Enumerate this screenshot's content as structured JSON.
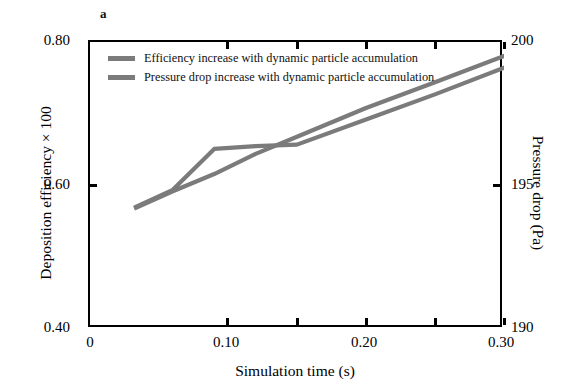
{
  "figure": {
    "panel_label": "a"
  },
  "legend": {
    "items": [
      {
        "label": "Efficiency increase with dynamic particle accumulation",
        "color": "#7b7b7b"
      },
      {
        "label": "Pressure drop increase with dynamic particle accumulation",
        "color": "#7b7b7b"
      }
    ]
  },
  "axes": {
    "x": {
      "title": "Simulation time (s)",
      "ticks": [
        "0",
        "0.10",
        "0.20",
        "0.30"
      ],
      "tick_values": [
        0,
        0.1,
        0.2,
        0.3
      ],
      "minor_tick_values": [
        0.05,
        0.15,
        0.25
      ],
      "range": [
        0,
        0.3
      ]
    },
    "y_left": {
      "title": "Deposition efficiency × 100",
      "ticks": [
        "0.40",
        "0.60",
        "0.80"
      ],
      "tick_values": [
        0.4,
        0.6,
        0.8
      ],
      "range": [
        0.4,
        0.8
      ]
    },
    "y_right": {
      "title": "Pressure drop (Pa)",
      "ticks": [
        "190",
        "195",
        "200"
      ],
      "tick_values": [
        190,
        195,
        200
      ],
      "range": [
        190,
        200
      ]
    }
  },
  "chart_data": {
    "type": "line",
    "title": "",
    "subtitle": "",
    "panel": "a",
    "xlabel": "Simulation time (s)",
    "ylabel": "Deposition efficiency × 100",
    "ylabel_secondary": "Pressure drop (Pa)",
    "xlim": [
      0,
      0.3
    ],
    "ylim": [
      0.4,
      0.8
    ],
    "ylim_secondary": [
      190,
      200
    ],
    "grid": false,
    "legend_position": "upper-left-inside",
    "series": [
      {
        "name": "Efficiency increase with dynamic particle accumulation",
        "axis": "left",
        "color": "#7b7b7b",
        "x": [
          0.032,
          0.06,
          0.09,
          0.12,
          0.15,
          0.2,
          0.25,
          0.305
        ],
        "values": [
          0.569,
          0.594,
          0.651,
          0.655,
          0.657,
          0.692,
          0.727,
          0.768
        ]
      },
      {
        "name": "Pressure drop increase with dynamic particle accumulation",
        "axis": "right",
        "color": "#7b7b7b",
        "x": [
          0.032,
          0.06,
          0.09,
          0.12,
          0.15,
          0.2,
          0.25,
          0.305
        ],
        "values": [
          194.2,
          194.8,
          195.4,
          196.1,
          196.7,
          197.7,
          198.6,
          199.6
        ]
      }
    ]
  }
}
